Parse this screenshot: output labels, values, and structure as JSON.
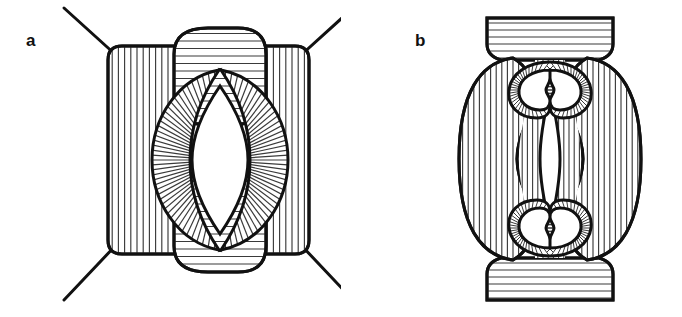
{
  "figure": {
    "type": "line-art-diagram",
    "background_color": "#ffffff",
    "ink_color": "#111111",
    "hatch_color": "#3a3a3a",
    "width": 682,
    "height": 317,
    "panel_count": 2
  },
  "panels": [
    {
      "id": "a",
      "label": "a",
      "label_position": {
        "x": 26,
        "y": 32
      },
      "description": "Square rounded body with four radiating diagonal lines at the corners, vertical hatching, horizontally hatched top and bottom caps, and a central ovoid with radially hatched halves enclosing a white lens-shaped lumen.",
      "elements": [
        {
          "name": "corner-ray-top-left",
          "hatch": "none",
          "stroke_width": 3
        },
        {
          "name": "corner-ray-top-right",
          "hatch": "none",
          "stroke_width": 3
        },
        {
          "name": "corner-ray-bottom-left",
          "hatch": "none",
          "stroke_width": 3
        },
        {
          "name": "corner-ray-bottom-right",
          "hatch": "none",
          "stroke_width": 3
        },
        {
          "name": "square-body",
          "hatch": "vertical",
          "hatch_spacing": 6.2
        },
        {
          "name": "top-cap",
          "hatch": "horizontal",
          "hatch_spacing": 7.5
        },
        {
          "name": "bottom-cap",
          "hatch": "horizontal",
          "hatch_spacing": 7.5
        },
        {
          "name": "central-ovoid-left-half",
          "hatch": "radial",
          "ray_count": 44
        },
        {
          "name": "central-ovoid-right-half",
          "hatch": "radial",
          "ray_count": 44
        },
        {
          "name": "central-lumen",
          "hatch": "none",
          "fill": "#ffffff"
        }
      ]
    },
    {
      "id": "b",
      "label": "b",
      "label_position": {
        "x": 415,
        "y": 32
      },
      "description": "Vertically elongated body with flared horizontally hatched top and bottom caps, two vertically hatched lateral lobes, an hourglass central column with a narrow white vertical lens slit, and two butterfly-shaped lumens with finely radial-hatched rims at top and bottom.",
      "elements": [
        {
          "name": "top-cap",
          "hatch": "horizontal",
          "hatch_spacing": 7.0
        },
        {
          "name": "bottom-cap",
          "hatch": "horizontal",
          "hatch_spacing": 7.0
        },
        {
          "name": "left-lobe",
          "hatch": "vertical",
          "hatch_spacing": 5.6
        },
        {
          "name": "right-lobe",
          "hatch": "vertical",
          "hatch_spacing": 5.6
        },
        {
          "name": "central-column",
          "hatch": "vertical",
          "hatch_spacing": 5.2
        },
        {
          "name": "central-slit",
          "hatch": "none",
          "fill": "#ffffff"
        },
        {
          "name": "upper-butterfly-rim",
          "hatch": "radial",
          "ray_count": 64
        },
        {
          "name": "upper-butterfly-lumen",
          "hatch": "none",
          "fill": "#ffffff"
        },
        {
          "name": "lower-butterfly-rim",
          "hatch": "radial",
          "ray_count": 64
        },
        {
          "name": "lower-butterfly-lumen",
          "hatch": "none",
          "fill": "#ffffff"
        }
      ]
    }
  ]
}
